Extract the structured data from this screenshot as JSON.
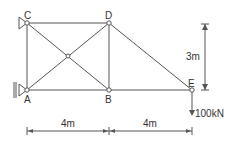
{
  "diagram": {
    "type": "truss",
    "nodes": {
      "A": {
        "label": "A",
        "x": 0,
        "y": 0
      },
      "B": {
        "label": "B",
        "x": 4,
        "y": 0
      },
      "C": {
        "label": "C",
        "x": 0,
        "y": 3
      },
      "D": {
        "label": "D",
        "x": 4,
        "y": 3
      },
      "E": {
        "label": "E",
        "x": 8,
        "y": 0
      }
    },
    "members": [
      "A-B",
      "B-E",
      "C-D",
      "A-C",
      "B-D",
      "D-E",
      "A-D",
      "C-B"
    ],
    "supports": {
      "C": "pin",
      "A": "roller"
    },
    "load": {
      "node": "E",
      "label": "100kN",
      "direction": "down"
    },
    "dimensions": {
      "horizontal": [
        "4m",
        "4m"
      ],
      "vertical": "3m"
    },
    "colors": {
      "line": "#555555",
      "text": "#333333"
    }
  }
}
